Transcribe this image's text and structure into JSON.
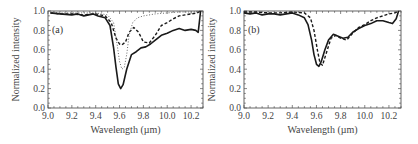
{
  "chart_data": [
    {
      "type": "line",
      "panel_label": "(a)",
      "xlabel": "Wavelength (µm)",
      "ylabel": "Normalized intensity",
      "xlim": [
        9.0,
        10.3
      ],
      "ylim": [
        0.0,
        1.0
      ],
      "xticks": [
        "9.0",
        "9.2",
        "9.4",
        "9.6",
        "9.8",
        "10.0",
        "10.2"
      ],
      "yticks": [
        "0.0",
        "0.2",
        "0.4",
        "0.6",
        "0.8",
        "1.0"
      ],
      "grid": false,
      "legend": null,
      "series": [
        {
          "name": "solid",
          "style": "solid",
          "x": [
            9.02,
            9.1,
            9.2,
            9.25,
            9.3,
            9.38,
            9.42,
            9.48,
            9.52,
            9.55,
            9.57,
            9.59,
            9.61,
            9.63,
            9.66,
            9.7,
            9.74,
            9.78,
            9.82,
            9.86,
            9.9,
            9.95,
            10.0,
            10.05,
            10.1,
            10.15,
            10.2,
            10.24,
            10.26,
            10.28
          ],
          "y": [
            0.98,
            0.97,
            0.96,
            0.97,
            0.95,
            0.97,
            0.95,
            0.93,
            0.85,
            0.62,
            0.42,
            0.25,
            0.2,
            0.24,
            0.4,
            0.55,
            0.58,
            0.62,
            0.63,
            0.66,
            0.7,
            0.75,
            0.77,
            0.8,
            0.82,
            0.8,
            0.81,
            0.8,
            0.78,
            1.0
          ]
        },
        {
          "name": "dashed",
          "style": "dashed",
          "x": [
            9.02,
            9.1,
            9.2,
            9.3,
            9.4,
            9.48,
            9.53,
            9.57,
            9.6,
            9.62,
            9.65,
            9.68,
            9.72,
            9.76,
            9.8,
            9.85,
            9.9,
            9.95,
            10.0,
            10.05,
            10.1,
            10.15,
            10.2,
            10.25,
            10.28
          ],
          "y": [
            0.98,
            0.97,
            0.97,
            0.96,
            0.97,
            0.95,
            0.88,
            0.72,
            0.66,
            0.65,
            0.68,
            0.78,
            0.83,
            0.78,
            0.68,
            0.67,
            0.75,
            0.85,
            0.88,
            0.92,
            0.95,
            0.96,
            0.97,
            0.98,
            1.0
          ]
        },
        {
          "name": "dotted",
          "style": "dotted",
          "x": [
            9.02,
            9.1,
            9.2,
            9.3,
            9.4,
            9.5,
            9.55,
            9.58,
            9.6,
            9.62,
            9.64,
            9.66,
            9.68,
            9.71,
            9.75,
            9.8,
            9.9,
            10.0,
            10.1,
            10.2,
            10.28
          ],
          "y": [
            0.99,
            0.98,
            0.98,
            0.98,
            0.98,
            0.96,
            0.88,
            0.65,
            0.48,
            0.4,
            0.42,
            0.55,
            0.75,
            0.88,
            0.93,
            0.95,
            0.97,
            0.98,
            0.99,
            0.99,
            1.0
          ]
        }
      ]
    },
    {
      "type": "line",
      "panel_label": "(b)",
      "xlabel": "Wavelength (µm)",
      "ylabel": "Normalized intensity",
      "xlim": [
        9.0,
        10.3
      ],
      "ylim": [
        0.0,
        1.0
      ],
      "xticks": [
        "9.0",
        "9.2",
        "9.4",
        "9.6",
        "9.8",
        "10.0",
        "10.2"
      ],
      "yticks": [
        "0.0",
        "0.2",
        "0.4",
        "0.6",
        "0.8",
        "1.0"
      ],
      "grid": false,
      "legend": null,
      "series": [
        {
          "name": "solid",
          "style": "solid",
          "x": [
            9.0,
            9.05,
            9.1,
            9.15,
            9.2,
            9.25,
            9.3,
            9.35,
            9.4,
            9.45,
            9.5,
            9.53,
            9.56,
            9.58,
            9.6,
            9.62,
            9.64,
            9.67,
            9.7,
            9.74,
            9.78,
            9.82,
            9.86,
            9.9,
            9.95,
            10.0,
            10.05,
            10.1,
            10.15,
            10.2,
            10.23,
            10.26,
            10.28
          ],
          "y": [
            0.98,
            0.97,
            0.98,
            0.96,
            0.97,
            0.97,
            0.96,
            0.97,
            0.98,
            0.96,
            0.93,
            0.86,
            0.7,
            0.55,
            0.45,
            0.43,
            0.48,
            0.6,
            0.7,
            0.76,
            0.74,
            0.72,
            0.73,
            0.78,
            0.82,
            0.85,
            0.87,
            0.9,
            0.9,
            0.88,
            0.87,
            0.92,
            1.0
          ]
        },
        {
          "name": "dashed",
          "style": "dashed",
          "x": [
            9.0,
            9.1,
            9.2,
            9.3,
            9.4,
            9.5,
            9.55,
            9.58,
            9.61,
            9.63,
            9.65,
            9.68,
            9.72,
            9.76,
            9.8,
            9.85,
            9.9,
            9.95,
            10.0,
            10.05,
            10.1,
            10.15,
            10.2,
            10.25,
            10.28
          ],
          "y": [
            0.99,
            0.99,
            0.98,
            0.98,
            0.99,
            0.98,
            0.93,
            0.8,
            0.58,
            0.46,
            0.44,
            0.56,
            0.72,
            0.75,
            0.72,
            0.7,
            0.77,
            0.83,
            0.86,
            0.9,
            0.93,
            0.95,
            0.97,
            0.98,
            1.0
          ]
        }
      ]
    }
  ]
}
